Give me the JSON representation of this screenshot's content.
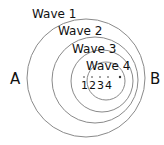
{
  "waves": [
    {
      "label": "Wave 1",
      "cx": 86,
      "cy": 78,
      "r": 59
    },
    {
      "label": "Wave 2",
      "cx": 95,
      "cy": 80,
      "r": 43
    },
    {
      "label": "Wave 3",
      "cx": 102,
      "cy": 81,
      "r": 31
    },
    {
      "label": "Wave 4",
      "cx": 106,
      "cy": 81,
      "r": 19
    }
  ],
  "points": {
    "A": "A",
    "B": "B",
    "sources": [
      "1",
      "2",
      "3",
      "4"
    ]
  },
  "colors": {
    "circle": "#8a8a8a",
    "text": "#111111"
  }
}
